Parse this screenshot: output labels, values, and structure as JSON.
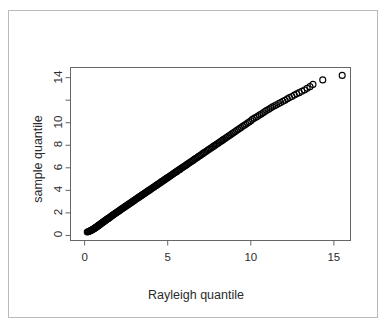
{
  "figure": {
    "background_color": "#ffffff",
    "border_color": "#b9b9b9",
    "axis_color": "#666666",
    "text_color": "#2b2b2b",
    "point_color": "#000000"
  },
  "chart_data": {
    "type": "scatter",
    "title": "",
    "xlabel": "Rayleigh quantile",
    "ylabel": "sample quantile",
    "xlim": [
      -0.85,
      16.0
    ],
    "ylim": [
      -0.45,
      14.9
    ],
    "xticks": [
      0,
      5,
      10,
      15
    ],
    "xtick_labels": [
      "0",
      "5",
      "10",
      "15"
    ],
    "yticks": [
      0,
      2,
      4,
      6,
      8,
      10,
      12,
      14
    ],
    "ytick_labels": [
      "0",
      "2",
      "4",
      "6",
      "8",
      "10",
      "",
      "14"
    ],
    "grid": false,
    "legend": null,
    "marker": "open-circle",
    "marker_size": 3.0,
    "x": [
      0.16,
      0.22,
      0.27,
      0.31,
      0.35,
      0.39,
      0.43,
      0.46,
      0.5,
      0.53,
      0.57,
      0.6,
      0.63,
      0.66,
      0.69,
      0.72,
      0.75,
      0.78,
      0.81,
      0.84,
      0.88,
      0.91,
      0.94,
      0.97,
      1.0,
      1.04,
      1.07,
      1.1,
      1.14,
      1.17,
      1.21,
      1.25,
      1.28,
      1.32,
      1.36,
      1.4,
      1.44,
      1.48,
      1.52,
      1.56,
      1.6,
      1.64,
      1.68,
      1.72,
      1.77,
      1.81,
      1.85,
      1.9,
      1.94,
      1.99,
      2.03,
      2.08,
      2.12,
      2.17,
      2.22,
      2.26,
      2.31,
      2.36,
      2.41,
      2.46,
      2.51,
      2.56,
      2.61,
      2.66,
      2.71,
      2.76,
      2.81,
      2.86,
      2.92,
      2.97,
      3.02,
      3.07,
      3.13,
      3.18,
      3.24,
      3.29,
      3.35,
      3.4,
      3.46,
      3.51,
      3.57,
      3.63,
      3.68,
      3.74,
      3.8,
      3.86,
      3.91,
      3.97,
      4.03,
      4.09,
      4.15,
      4.21,
      4.27,
      4.33,
      4.39,
      4.45,
      4.51,
      4.57,
      4.63,
      4.7,
      4.76,
      4.82,
      4.88,
      4.95,
      5.01,
      5.07,
      5.14,
      5.2,
      5.27,
      5.33,
      5.4,
      5.46,
      5.53,
      5.59,
      5.66,
      5.73,
      5.79,
      5.86,
      5.93,
      6.0,
      6.07,
      6.14,
      6.21,
      6.28,
      6.35,
      6.42,
      6.49,
      6.56,
      6.63,
      6.7,
      6.78,
      6.85,
      6.92,
      7.0,
      7.07,
      7.15,
      7.22,
      7.3,
      7.38,
      7.45,
      7.53,
      7.61,
      7.69,
      7.77,
      7.85,
      7.93,
      8.01,
      8.09,
      8.18,
      8.26,
      8.34,
      8.43,
      8.51,
      8.6,
      8.69,
      8.78,
      8.86,
      8.95,
      9.04,
      9.14,
      9.23,
      9.32,
      9.41,
      9.51,
      9.61,
      9.7,
      9.8,
      9.9,
      10.0,
      10.1,
      10.2,
      10.31,
      10.41,
      10.52,
      10.63,
      10.74,
      10.85,
      10.96,
      11.08,
      11.19,
      11.31,
      11.43,
      11.55,
      11.68,
      11.8,
      11.93,
      12.06,
      12.2,
      12.33,
      12.47,
      12.62,
      12.76,
      12.91,
      13.07,
      13.23,
      13.39,
      13.56,
      13.74,
      14.33,
      15.5
    ],
    "y": [
      0.3,
      0.33,
      0.36,
      0.39,
      0.42,
      0.45,
      0.48,
      0.51,
      0.54,
      0.57,
      0.61,
      0.64,
      0.67,
      0.7,
      0.73,
      0.76,
      0.79,
      0.82,
      0.86,
      0.89,
      0.93,
      0.96,
      0.99,
      1.03,
      1.07,
      1.1,
      1.14,
      1.17,
      1.21,
      1.25,
      1.29,
      1.33,
      1.37,
      1.41,
      1.45,
      1.49,
      1.53,
      1.57,
      1.61,
      1.65,
      1.7,
      1.74,
      1.78,
      1.83,
      1.87,
      1.92,
      1.96,
      2.01,
      2.05,
      2.1,
      2.14,
      2.19,
      2.24,
      2.29,
      2.34,
      2.38,
      2.43,
      2.48,
      2.53,
      2.58,
      2.63,
      2.68,
      2.73,
      2.78,
      2.83,
      2.88,
      2.93,
      2.99,
      3.04,
      3.09,
      3.15,
      3.2,
      3.25,
      3.31,
      3.36,
      3.42,
      3.47,
      3.53,
      3.58,
      3.64,
      3.7,
      3.75,
      3.81,
      3.87,
      3.93,
      3.98,
      4.04,
      4.1,
      4.16,
      4.22,
      4.28,
      4.34,
      4.4,
      4.46,
      4.52,
      4.58,
      4.64,
      4.7,
      4.77,
      4.83,
      4.89,
      4.95,
      5.02,
      5.08,
      5.14,
      5.21,
      5.27,
      5.34,
      5.4,
      5.47,
      5.53,
      5.6,
      5.66,
      5.73,
      5.8,
      5.86,
      5.93,
      6.0,
      6.07,
      6.14,
      6.21,
      6.28,
      6.35,
      6.42,
      6.49,
      6.56,
      6.63,
      6.7,
      6.78,
      6.85,
      6.92,
      7.0,
      7.07,
      7.14,
      7.22,
      7.3,
      7.37,
      7.45,
      7.53,
      7.6,
      7.68,
      7.76,
      7.84,
      7.92,
      8.0,
      8.08,
      8.16,
      8.25,
      8.33,
      8.41,
      8.5,
      8.58,
      8.67,
      8.76,
      8.84,
      8.93,
      9.02,
      9.11,
      9.2,
      9.3,
      9.39,
      9.48,
      9.58,
      9.68,
      9.77,
      9.87,
      9.97,
      10.07,
      10.18,
      10.3,
      10.4,
      10.48,
      10.58,
      10.68,
      10.78,
      10.88,
      10.99,
      11.1,
      11.2,
      11.3,
      11.41,
      11.5,
      11.6,
      11.71,
      11.8,
      11.9,
      12.0,
      12.12,
      12.23,
      12.33,
      12.45,
      12.56,
      12.67,
      12.79,
      12.9,
      13.05,
      13.2,
      13.4,
      13.8,
      14.2
    ]
  }
}
